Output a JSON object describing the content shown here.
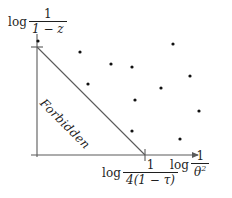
{
  "figure": {
    "background_color": "#ffffff",
    "ink_color": "#1f1f1f",
    "axis_color": "#555555",
    "point_color": "#111111"
  },
  "labels": {
    "y_axis": {
      "operator": "log",
      "numerator": "1",
      "denominator": "1 − z",
      "full": "log 1/(1 − z)"
    },
    "x_axis": {
      "operator": "log",
      "numerator": "1",
      "denominator": "θ",
      "denominator_exponent": "2",
      "full": "log 1/θ²"
    },
    "x_tick": {
      "operator": "log",
      "numerator": "1",
      "denominator": "4(1 − τ)",
      "full": "log 1/(4(1 − τ))"
    },
    "region": {
      "text": "Forbidden",
      "rotation_deg": 45
    }
  },
  "chart_data": {
    "type": "scatter",
    "title": "",
    "xlabel": "log 1/θ²",
    "ylabel": "log 1/(1 − z)",
    "xlim": [
      0,
      1.55
    ],
    "ylim": [
      0,
      1.12
    ],
    "grid": false,
    "legend": null,
    "annotations": [
      {
        "text": "Forbidden",
        "kind": "region-label",
        "x": 0.33,
        "y": 0.38,
        "rotation_deg": 45
      }
    ],
    "axis_ticks": {
      "x": [
        {
          "value": 1.0,
          "label": "log 1/(4(1 − τ))"
        }
      ],
      "y": [
        {
          "value": 1.0,
          "label": ""
        }
      ]
    },
    "boundary_line": {
      "name": "forbidden-boundary",
      "from": {
        "x": 0.0,
        "y": 1.0
      },
      "to": {
        "x": 1.0,
        "y": 0.0
      },
      "style": "solid"
    },
    "series": [
      {
        "name": "allowed-points",
        "marker": "dot",
        "points": [
          {
            "x": 0.01,
            "y": 1.06
          },
          {
            "x": 0.4,
            "y": 0.95
          },
          {
            "x": 0.69,
            "y": 0.84
          },
          {
            "x": 0.88,
            "y": 0.81
          },
          {
            "x": 1.26,
            "y": 1.03
          },
          {
            "x": 0.47,
            "y": 0.66
          },
          {
            "x": 1.42,
            "y": 0.73
          },
          {
            "x": 1.15,
            "y": 0.62
          },
          {
            "x": 0.91,
            "y": 0.51
          },
          {
            "x": 1.51,
            "y": 0.41
          },
          {
            "x": 0.88,
            "y": 0.22
          },
          {
            "x": 1.37,
            "y": 0.15
          }
        ]
      }
    ]
  },
  "geometry": {
    "origin_px": {
      "x": 37,
      "y": 155
    },
    "y_axis_top_px": 32,
    "x_axis_right_px": 202,
    "y_tick_px": {
      "x": 37,
      "y": 47
    },
    "x_tick_px": {
      "x": 145,
      "y": 155
    },
    "point_radius_px": 1.6,
    "points_px": [
      {
        "x": 38,
        "y": 41
      },
      {
        "x": 80,
        "y": 52
      },
      {
        "x": 111,
        "y": 64
      },
      {
        "x": 132,
        "y": 67
      },
      {
        "x": 173,
        "y": 44
      },
      {
        "x": 88,
        "y": 84
      },
      {
        "x": 190,
        "y": 76
      },
      {
        "x": 161,
        "y": 88
      },
      {
        "x": 135,
        "y": 100
      },
      {
        "x": 199,
        "y": 111
      },
      {
        "x": 132,
        "y": 131
      },
      {
        "x": 180,
        "y": 139
      }
    ]
  }
}
